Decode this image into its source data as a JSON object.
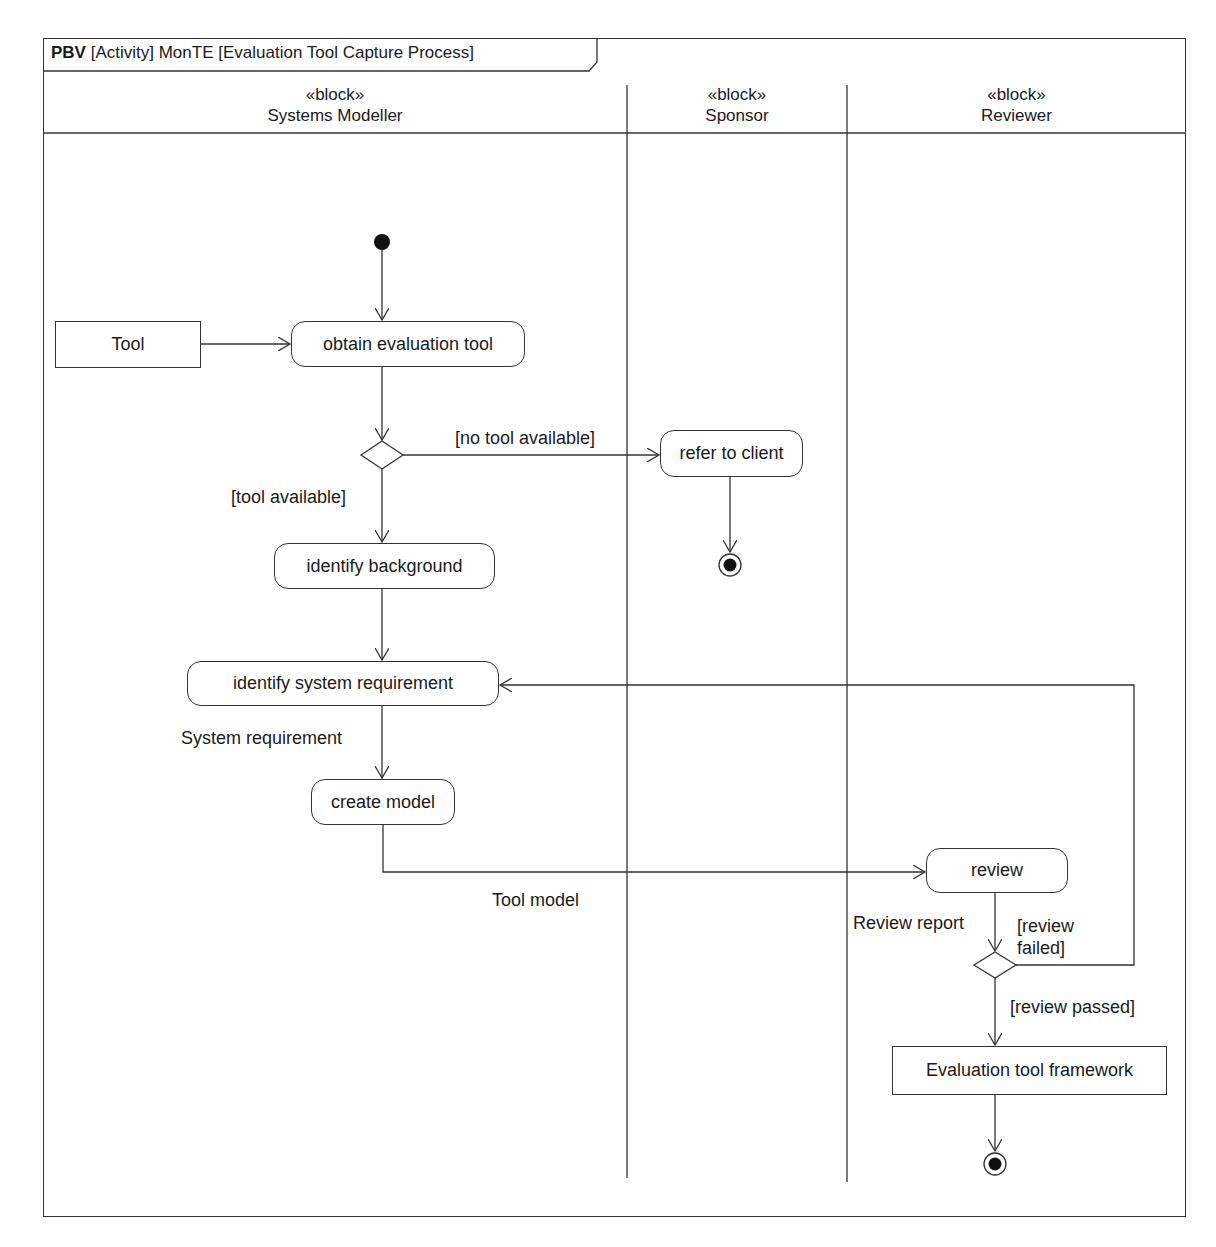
{
  "diagram": {
    "frame_title": {
      "kind": "PBV",
      "text": "[Activity] MonTE [Evaluation Tool Capture Process]"
    },
    "swimlanes": [
      {
        "stereotype": "«block»",
        "name": "Systems Modeller"
      },
      {
        "stereotype": "«block»",
        "name": "Sponsor"
      },
      {
        "stereotype": "«block»",
        "name": "Reviewer"
      }
    ],
    "object_nodes": {
      "tool": "Tool",
      "evaluation_tool_framework": "Evaluation tool framework"
    },
    "actions": {
      "obtain_evaluation_tool": "obtain evaluation tool",
      "refer_to_client": "refer to client",
      "identify_background": "identify background",
      "identify_system_requirement": "identify system requirement",
      "create_model": "create model",
      "review": "review"
    },
    "guards": {
      "no_tool_available": "[no tool available]",
      "tool_available": "[tool available]",
      "review_failed_line1": "[review",
      "review_failed_line2": "failed]",
      "review_passed": "[review passed]"
    },
    "pin_labels": {
      "system_requirement": "System requirement",
      "tool_model": "Tool model",
      "review_report": "Review report"
    }
  }
}
